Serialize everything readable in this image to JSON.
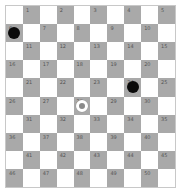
{
  "board": {
    "size": 10,
    "colors": {
      "light": "#ffffff",
      "dark": "#a9a9a9"
    },
    "squares": [
      1,
      2,
      3,
      4,
      5,
      6,
      7,
      8,
      9,
      10,
      11,
      12,
      13,
      14,
      15,
      16,
      17,
      18,
      19,
      20,
      21,
      22,
      23,
      24,
      25,
      26,
      27,
      28,
      29,
      30,
      31,
      32,
      33,
      34,
      35,
      36,
      37,
      38,
      39,
      40,
      41,
      42,
      43,
      44,
      45,
      46,
      47,
      48,
      49,
      50
    ],
    "pieces": [
      {
        "square": 6,
        "color": "black",
        "kind": "man"
      },
      {
        "square": 24,
        "color": "black",
        "kind": "man"
      },
      {
        "square": 28,
        "color": "white",
        "kind": "man"
      }
    ]
  }
}
